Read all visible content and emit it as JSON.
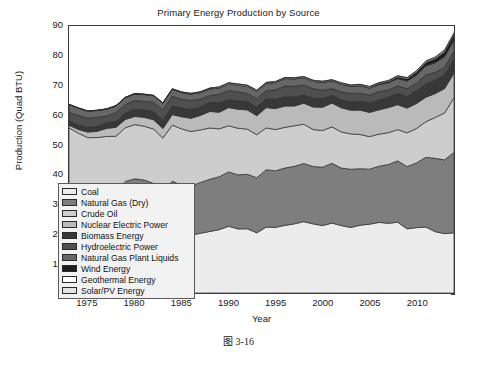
{
  "figure": {
    "caption": "图 3-16"
  },
  "chart_data": {
    "type": "area",
    "stacked": true,
    "title": "Primary Energy Production by Source",
    "xlabel": "Year",
    "ylabel": "Production (Quad BTU)",
    "xlim": [
      1973,
      2014
    ],
    "ylim": [
      0,
      90
    ],
    "xticks": [
      1975,
      1980,
      1985,
      1990,
      1995,
      2000,
      2005,
      2010
    ],
    "yticks": [
      0,
      10,
      20,
      30,
      40,
      50,
      60,
      70,
      80,
      90
    ],
    "grid": false,
    "legend_position": "center-left",
    "x": [
      1973,
      1974,
      1975,
      1976,
      1977,
      1978,
      1979,
      1980,
      1981,
      1982,
      1983,
      1984,
      1985,
      1986,
      1987,
      1988,
      1989,
      1990,
      1991,
      1992,
      1993,
      1994,
      1995,
      1996,
      1997,
      1998,
      1999,
      2000,
      2001,
      2002,
      2003,
      2004,
      2005,
      2006,
      2007,
      2008,
      2009,
      2010,
      2011,
      2012,
      2013,
      2014
    ],
    "series": [
      {
        "name": "Coal",
        "color": "#ececec",
        "values": [
          13.99,
          14.07,
          14.99,
          15.65,
          15.76,
          14.91,
          17.54,
          18.6,
          18.38,
          18.64,
          17.25,
          19.72,
          19.33,
          19.51,
          20.14,
          20.74,
          21.36,
          22.49,
          21.59,
          21.63,
          20.29,
          22.2,
          22.13,
          22.79,
          23.31,
          24.05,
          23.3,
          22.74,
          23.55,
          22.73,
          22.09,
          22.85,
          23.19,
          23.79,
          23.49,
          23.85,
          21.62,
          22.04,
          22.22,
          20.68,
          20.0,
          20.29
        ]
      },
      {
        "name": "Natural Gas (Dry)",
        "color": "#7e7e7e",
        "values": [
          22.19,
          21.21,
          19.64,
          19.48,
          19.57,
          19.49,
          20.08,
          19.91,
          19.7,
          18.32,
          16.59,
          18.01,
          16.98,
          16.54,
          17.14,
          17.6,
          17.85,
          18.33,
          18.23,
          18.38,
          18.58,
          19.35,
          19.08,
          19.34,
          19.39,
          19.61,
          19.34,
          19.66,
          20.17,
          19.38,
          19.63,
          19.07,
          18.56,
          18.94,
          19.82,
          20.7,
          21.0,
          21.81,
          23.51,
          24.71,
          24.89,
          27.09
        ]
      },
      {
        "name": "Crude Oil",
        "color": "#cdcdcd",
        "values": [
          19.49,
          18.58,
          17.73,
          17.26,
          17.45,
          18.43,
          18.1,
          18.25,
          18.15,
          18.31,
          18.39,
          18.85,
          18.99,
          18.38,
          17.68,
          17.28,
          16.12,
          15.57,
          15.7,
          15.22,
          14.49,
          14.1,
          13.89,
          13.72,
          13.66,
          13.24,
          12.45,
          12.36,
          12.28,
          12.16,
          11.94,
          11.5,
          10.96,
          10.8,
          10.72,
          10.51,
          11.35,
          11.59,
          11.99,
          13.78,
          15.77,
          18.47
        ]
      },
      {
        "name": "Nuclear Electric Power",
        "color": "#bababa",
        "values": [
          0.91,
          1.27,
          1.9,
          2.11,
          2.7,
          3.02,
          2.78,
          2.74,
          3.01,
          3.13,
          3.2,
          3.55,
          4.08,
          4.47,
          4.91,
          5.59,
          5.6,
          6.1,
          6.42,
          6.48,
          6.41,
          6.84,
          7.08,
          7.17,
          6.68,
          7.07,
          7.61,
          7.86,
          8.03,
          8.14,
          7.96,
          8.23,
          8.16,
          8.21,
          8.46,
          8.43,
          8.35,
          8.43,
          8.27,
          8.06,
          8.24,
          8.33
        ]
      },
      {
        "name": "Biomass Energy",
        "color": "#383838",
        "values": [
          1.53,
          1.54,
          1.5,
          1.71,
          1.84,
          2.04,
          2.15,
          2.48,
          2.59,
          2.66,
          2.83,
          2.88,
          2.96,
          2.93,
          2.86,
          3.02,
          3.16,
          2.74,
          2.78,
          2.92,
          2.9,
          2.99,
          3.1,
          3.13,
          2.98,
          2.86,
          2.89,
          2.91,
          2.64,
          2.7,
          2.82,
          3.02,
          3.13,
          3.27,
          3.5,
          3.85,
          3.88,
          4.3,
          4.49,
          4.51,
          4.69,
          4.8
        ]
      },
      {
        "name": "Hydroelectric Power",
        "color": "#4f4f4f",
        "values": [
          2.86,
          3.18,
          3.16,
          2.98,
          2.33,
          2.94,
          2.93,
          2.9,
          2.76,
          3.27,
          3.53,
          3.39,
          2.97,
          3.07,
          2.63,
          2.33,
          2.84,
          3.05,
          3.02,
          2.62,
          2.89,
          2.68,
          3.21,
          3.59,
          3.64,
          3.3,
          3.27,
          2.81,
          2.24,
          2.69,
          2.83,
          2.69,
          2.7,
          2.87,
          2.45,
          2.51,
          2.67,
          2.54,
          3.1,
          2.63,
          2.56,
          2.47
        ]
      },
      {
        "name": "Natural Gas Plant Liquids",
        "color": "#676767",
        "values": [
          2.57,
          2.47,
          2.37,
          2.33,
          2.33,
          2.25,
          2.29,
          2.25,
          2.31,
          2.19,
          2.18,
          2.27,
          2.24,
          2.15,
          2.22,
          2.26,
          2.16,
          2.18,
          2.3,
          2.36,
          2.37,
          2.39,
          2.44,
          2.53,
          2.5,
          2.42,
          2.42,
          2.61,
          2.55,
          2.56,
          2.35,
          2.47,
          2.33,
          2.36,
          2.41,
          2.41,
          2.57,
          2.75,
          2.93,
          3.25,
          3.52,
          3.79
        ]
      },
      {
        "name": "Wind Energy",
        "color": "#1c1c1c",
        "values": [
          0.0,
          0.0,
          0.0,
          0.0,
          0.0,
          0.0,
          0.0,
          0.0,
          0.0,
          0.0,
          0.0,
          0.01,
          0.01,
          0.01,
          0.01,
          0.01,
          0.02,
          0.03,
          0.03,
          0.03,
          0.03,
          0.04,
          0.03,
          0.03,
          0.03,
          0.03,
          0.05,
          0.06,
          0.07,
          0.11,
          0.12,
          0.14,
          0.18,
          0.26,
          0.34,
          0.55,
          0.72,
          0.92,
          1.17,
          1.34,
          1.6,
          1.73
        ]
      },
      {
        "name": "Geothermal Energy",
        "color": "#ffffff",
        "values": [
          0.04,
          0.05,
          0.07,
          0.08,
          0.08,
          0.06,
          0.08,
          0.11,
          0.12,
          0.1,
          0.13,
          0.16,
          0.2,
          0.22,
          0.23,
          0.22,
          0.32,
          0.34,
          0.35,
          0.35,
          0.36,
          0.34,
          0.29,
          0.32,
          0.33,
          0.33,
          0.33,
          0.32,
          0.31,
          0.33,
          0.33,
          0.34,
          0.35,
          0.34,
          0.35,
          0.36,
          0.37,
          0.38,
          0.39,
          0.4,
          0.41,
          0.42
        ]
      },
      {
        "name": "Solar/PV Energy",
        "color": "#e3e3e3",
        "values": [
          0.0,
          0.0,
          0.0,
          0.0,
          0.0,
          0.0,
          0.0,
          0.0,
          0.0,
          0.0,
          0.0,
          0.0,
          0.0,
          0.0,
          0.0,
          0.0,
          0.06,
          0.06,
          0.06,
          0.06,
          0.06,
          0.07,
          0.07,
          0.07,
          0.07,
          0.07,
          0.07,
          0.07,
          0.07,
          0.06,
          0.06,
          0.06,
          0.06,
          0.07,
          0.08,
          0.09,
          0.1,
          0.13,
          0.16,
          0.24,
          0.32,
          0.43
        ]
      }
    ]
  },
  "legend": {
    "items": [
      {
        "label": "Coal"
      },
      {
        "label": "Natural Gas (Dry)"
      },
      {
        "label": "Crude Oil"
      },
      {
        "label": "Nuclear Electric Power"
      },
      {
        "label": "Biomass Energy"
      },
      {
        "label": "Hydroelectric Power"
      },
      {
        "label": "Natural Gas Plant Liquids"
      },
      {
        "label": "Wind Energy"
      },
      {
        "label": "Geothermal Energy"
      },
      {
        "label": "Solar/PV Energy"
      }
    ]
  }
}
